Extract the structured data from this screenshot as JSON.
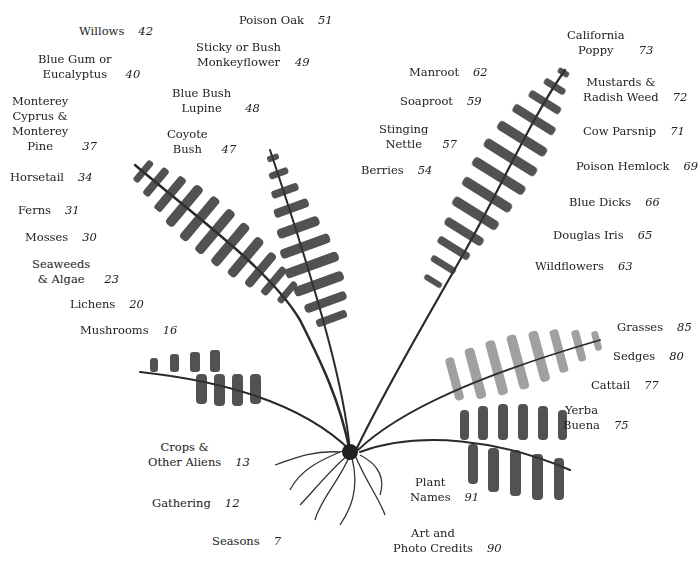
{
  "illustration": {
    "subject": "fern-print",
    "ink_color": "#2a2a2a"
  },
  "toc_entries": [
    {
      "label": "Willows",
      "page": "42",
      "x": 79,
      "y": 24
    },
    {
      "label": "Poison Oak",
      "page": "51",
      "x": 239,
      "y": 13
    },
    {
      "label": "Sticky or Bush\nMonkeyflower",
      "page": "49",
      "x": 196,
      "y": 40
    },
    {
      "label": "Blue Gum or\nEucalyptus",
      "page": "40",
      "x": 38,
      "y": 52
    },
    {
      "label": "Blue Bush\nLupine",
      "page": "48",
      "x": 172,
      "y": 86
    },
    {
      "label": "Monterey\nCyprus &\nMonterey\nPine",
      "page": "37",
      "x": 12,
      "y": 94
    },
    {
      "label": "Coyote\nBush",
      "page": "47",
      "x": 167,
      "y": 127
    },
    {
      "label": "Horsetail",
      "page": "34",
      "x": 10,
      "y": 170
    },
    {
      "label": "Ferns",
      "page": "31",
      "x": 18,
      "y": 203
    },
    {
      "label": "Mosses",
      "page": "30",
      "x": 25,
      "y": 230
    },
    {
      "label": "Seaweeds\n& Algae",
      "page": "23",
      "x": 32,
      "y": 257
    },
    {
      "label": "Lichens",
      "page": "20",
      "x": 70,
      "y": 297
    },
    {
      "label": "Mushrooms",
      "page": "16",
      "x": 80,
      "y": 323
    },
    {
      "label": "Crops &\nOther Aliens",
      "page": "13",
      "x": 148,
      "y": 440
    },
    {
      "label": "Gathering",
      "page": "12",
      "x": 152,
      "y": 496
    },
    {
      "label": "Seasons",
      "page": "7",
      "x": 212,
      "y": 534
    },
    {
      "label": "California\nPoppy",
      "page": "73",
      "x": 567,
      "y": 28
    },
    {
      "label": "Manroot",
      "page": "62",
      "x": 409,
      "y": 65
    },
    {
      "label": "Soaproot",
      "page": "59",
      "x": 400,
      "y": 94
    },
    {
      "label": "Mustards &\nRadish Weed",
      "page": "72",
      "x": 583,
      "y": 75
    },
    {
      "label": "Stinging\nNettle",
      "page": "57",
      "x": 379,
      "y": 122
    },
    {
      "label": "Cow Parsnip",
      "page": "71",
      "x": 583,
      "y": 124
    },
    {
      "label": "Berries",
      "page": "54",
      "x": 361,
      "y": 163
    },
    {
      "label": "Poison Hemlock",
      "page": "69",
      "x": 576,
      "y": 159
    },
    {
      "label": "Blue Dicks",
      "page": "66",
      "x": 569,
      "y": 195
    },
    {
      "label": "Douglas Iris",
      "page": "65",
      "x": 553,
      "y": 228
    },
    {
      "label": "Wildflowers",
      "page": "63",
      "x": 535,
      "y": 259
    },
    {
      "label": "Grasses",
      "page": "85",
      "x": 617,
      "y": 320
    },
    {
      "label": "Sedges",
      "page": "80",
      "x": 613,
      "y": 349
    },
    {
      "label": "Cattail",
      "page": "77",
      "x": 591,
      "y": 378
    },
    {
      "label": "Yerba\nBuena",
      "page": "75",
      "x": 563,
      "y": 403
    },
    {
      "label": "Plant\nNames",
      "page": "91",
      "x": 410,
      "y": 475
    },
    {
      "label": "Art and\nPhoto Credits",
      "page": "90",
      "x": 393,
      "y": 526
    }
  ]
}
